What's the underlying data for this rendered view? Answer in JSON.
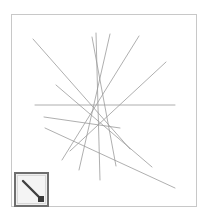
{
  "app": {
    "title": "Line Drawing Canvas",
    "background_color": "#ffffff"
  },
  "canvas": {
    "name": "drawing-canvas",
    "x": 11,
    "y": 14,
    "width": 186,
    "height": 193,
    "border_color": "#c8c8c8",
    "fill_color": "#ffffff",
    "stroke_color": "#9a9a9a",
    "stroke_width": 0.8,
    "lines": [
      {
        "id": "line-1",
        "x1": 33,
        "y1": 39,
        "x2": 130,
        "y2": 149
      },
      {
        "id": "line-2",
        "x1": 35,
        "y1": 105,
        "x2": 175,
        "y2": 105
      },
      {
        "id": "line-3",
        "x1": 45,
        "y1": 128,
        "x2": 175,
        "y2": 188
      },
      {
        "id": "line-4",
        "x1": 96,
        "y1": 33,
        "x2": 100,
        "y2": 180
      },
      {
        "id": "line-5",
        "x1": 110,
        "y1": 34,
        "x2": 79,
        "y2": 170
      },
      {
        "id": "line-6",
        "x1": 139,
        "y1": 36,
        "x2": 62,
        "y2": 160
      },
      {
        "id": "line-7",
        "x1": 166,
        "y1": 62,
        "x2": 70,
        "y2": 151
      },
      {
        "id": "line-8",
        "x1": 56,
        "y1": 85,
        "x2": 152,
        "y2": 167
      },
      {
        "id": "line-9",
        "x1": 92,
        "y1": 37,
        "x2": 116,
        "y2": 166
      },
      {
        "id": "line-10",
        "x1": 120,
        "y1": 128,
        "x2": 44,
        "y2": 117
      }
    ]
  },
  "toolbar": {
    "line_tool": {
      "name": "line-tool-button",
      "label": "Line",
      "icon": "diagonal-line-icon",
      "selected": true,
      "border_color": "#6e6e6e",
      "fill_color": "#f4f4f4",
      "glyph_color": "#404040",
      "handle_color": "#3a3a3a"
    }
  }
}
